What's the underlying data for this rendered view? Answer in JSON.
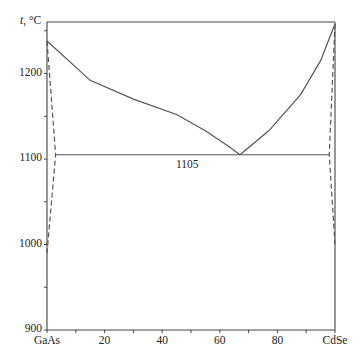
{
  "chart_data": {
    "type": "line",
    "title": "",
    "xlabel": "",
    "ylabel": "t, °C",
    "xlim": [
      0,
      100
    ],
    "ylim": [
      900,
      1260
    ],
    "x_tick_labels": [
      "GaAs",
      "20",
      "40",
      "60",
      "80",
      "CdSe"
    ],
    "x_ticks": [
      0,
      20,
      40,
      60,
      80,
      100
    ],
    "y_tick_labels": [
      "900",
      "1000",
      "1100",
      "1200"
    ],
    "y_ticks": [
      900,
      1000,
      1100,
      1200
    ],
    "grid": false,
    "annotations": [
      {
        "text": "1105",
        "x": 57,
        "y": 1092
      }
    ],
    "series": [
      {
        "name": "liquidus-left",
        "style": "solid",
        "x": [
          0,
          15,
          30,
          45,
          55,
          63,
          67
        ],
        "y": [
          1238,
          1192,
          1170,
          1152,
          1133,
          1115,
          1105
        ]
      },
      {
        "name": "liquidus-right",
        "style": "solid",
        "x": [
          67,
          77,
          88,
          95,
          100
        ],
        "y": [
          1105,
          1133,
          1175,
          1215,
          1258
        ]
      },
      {
        "name": "eutectic",
        "style": "solid",
        "x": [
          3,
          98
        ],
        "y": [
          1105,
          1105
        ]
      },
      {
        "name": "solvus-GaAs",
        "style": "dashed",
        "x": [
          0,
          3,
          0
        ],
        "y": [
          1238,
          1105,
          990
        ]
      },
      {
        "name": "solvus-CdSe",
        "style": "dashed",
        "x": [
          100,
          98,
          100
        ],
        "y": [
          1258,
          1105,
          1000
        ]
      }
    ]
  },
  "labels": {
    "ylabel": "t, °C",
    "eutectic": "1105",
    "y": [
      "900",
      "1000",
      "1100",
      "1200"
    ],
    "x": [
      "GaAs",
      "20",
      "40",
      "60",
      "80",
      "CdSe"
    ]
  }
}
